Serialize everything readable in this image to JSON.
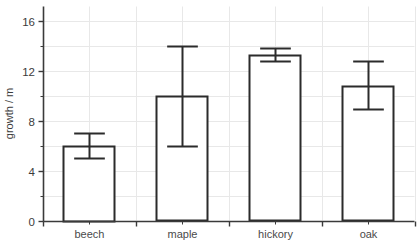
{
  "chart_data": {
    "type": "bar",
    "title": "",
    "subtitle": "",
    "xlabel": "",
    "ylabel": "growth / m",
    "categories": [
      "beech",
      "maple",
      "hickory",
      "oak"
    ],
    "values": [
      6.0,
      10.0,
      13.3,
      10.8
    ],
    "error_low": [
      5.0,
      6.0,
      12.8,
      9.0
    ],
    "error_high": [
      7.0,
      14.0,
      13.9,
      12.8
    ],
    "ylim": [
      0,
      17.2
    ],
    "xlim": [
      0,
      4
    ],
    "y_major_ticks": [
      0,
      4,
      8,
      12,
      16
    ],
    "y_major_tick_labels": [
      "0",
      "4",
      "8",
      "12",
      "16"
    ],
    "y_minor_ticks": [
      2,
      6,
      10,
      14
    ],
    "grid": {
      "horizontal": true,
      "vertical": true,
      "color": "#e8e8e8"
    },
    "legend": {
      "visible": false,
      "position": "none",
      "entries": []
    },
    "annotations": [],
    "style": {
      "bar_fill": "#ffffff",
      "bar_stroke": "#2b2b2b",
      "bar_stroke_width": 2,
      "bar_width_fraction": 0.55,
      "errorbar_color": "#2b2b2b",
      "errorbar_width": 2,
      "errorbar_cap_fraction": 0.3,
      "axis_color": "#3a3a3a",
      "background": "#ffffff",
      "tick_label_color": "#3b3b3b",
      "category_label_color": "#4a4a4a"
    }
  }
}
